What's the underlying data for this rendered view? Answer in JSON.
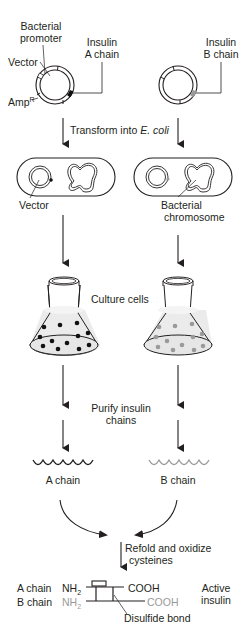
{
  "colors": {
    "ink": "#231f20",
    "a_chain": "#231f20",
    "b_chain": "#9a9a9a",
    "culture_fluid": "#ebebeb"
  },
  "plasmids": {
    "left": {
      "label_promoter_line1": "Bacterial",
      "label_promoter_line2": "promoter",
      "label_vector": "Vector",
      "label_amp": "Amp",
      "label_amp_sup": "R",
      "label_insert_line1": "Insulin",
      "label_insert_line2": "A chain"
    },
    "right": {
      "label_insert_line1": "Insulin",
      "label_insert_line2": "B chain"
    }
  },
  "steps": {
    "transform_prefix": "Transform into ",
    "transform_organism": "E. coli",
    "culture": "Culture cells",
    "purify_line1": "Purify insulin",
    "purify_line2": "chains",
    "refold_line1": "Refold and oxidize",
    "refold_line2": "cysteines"
  },
  "cells": {
    "left_label": "Vector",
    "right_label_line1": "Bacterial",
    "right_label_line2": "chromosome"
  },
  "chains": {
    "a_label": "A chain",
    "b_label": "B chain"
  },
  "product": {
    "a_chain_label": "A chain",
    "b_chain_label": "B chain",
    "nh2": "NH",
    "nh2_sub": "2",
    "cooh": "COOH",
    "disulfide_label": "Disulfide bond",
    "result_line1": "Active",
    "result_line2": "insulin"
  }
}
